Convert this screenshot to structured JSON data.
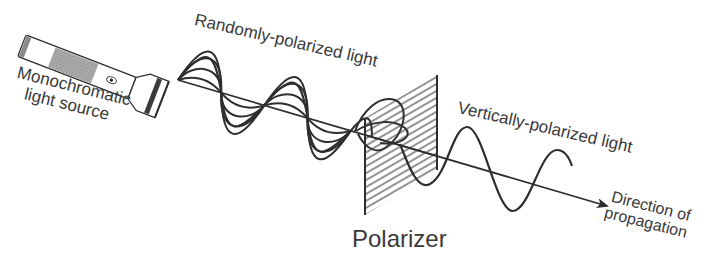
{
  "diagram": {
    "labels": {
      "source_line1": "Monochromatic",
      "source_line2": "light source",
      "random": "Randomly-polarized light",
      "vertical": "Vertically-polarized light",
      "polarizer": "Polarizer",
      "direction_line1": "Direction of",
      "direction_line2": "propagation"
    },
    "components": [
      {
        "id": "light-source",
        "type": "flashlight",
        "label": "Monochromatic light source"
      },
      {
        "id": "random-wave",
        "type": "multi-plane wave",
        "label": "Randomly-polarized light"
      },
      {
        "id": "polarizer",
        "type": "hatched filter",
        "label": "Polarizer"
      },
      {
        "id": "vertical-wave",
        "type": "sine wave",
        "label": "Vertically-polarized light"
      },
      {
        "id": "axis",
        "type": "arrow",
        "label": "Direction of propagation"
      }
    ],
    "edges": [
      {
        "from": "light-source",
        "to": "random-wave"
      },
      {
        "from": "random-wave",
        "to": "polarizer"
      },
      {
        "from": "polarizer",
        "to": "vertical-wave"
      }
    ],
    "colors": {
      "stroke": "#2e2e2e",
      "text": "#3a3a3a",
      "shade": "#9a9a9a",
      "background": "#ffffff"
    }
  }
}
